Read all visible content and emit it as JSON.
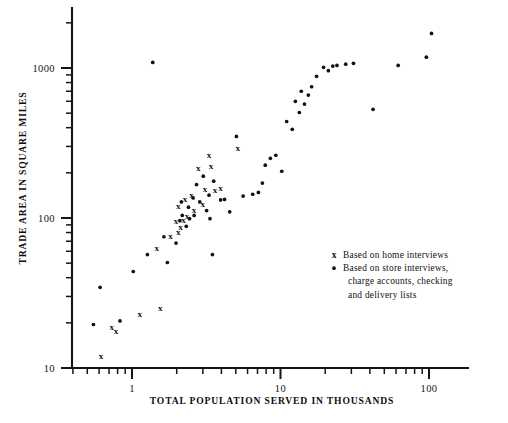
{
  "chart_data": {
    "type": "scatter",
    "title": "",
    "xlabel": "TOTAL POPULATION SERVED IN THOUSANDS",
    "ylabel": "TRADE AREA IN SQUARE MILES",
    "xscale": "log",
    "yscale": "log",
    "xlim": [
      0.5,
      200
    ],
    "ylim": [
      9,
      2500
    ],
    "xticks": [
      1,
      10,
      100
    ],
    "xticklabels": [
      "1",
      "10",
      "100"
    ],
    "yticks": [
      10,
      100,
      1000
    ],
    "yticklabels": [
      "10",
      "100",
      "1000"
    ],
    "grid": false,
    "legend_position": "lower-right-inside",
    "legend": [
      {
        "marker": "x",
        "label": "Based on home interviews"
      },
      {
        "marker": "dot",
        "label": "Based on store interviews, charge accounts, checking and delivery lists"
      }
    ],
    "legend_lines": [
      {
        "marker": "x",
        "text": "Based on home interviews"
      },
      {
        "marker": "dot",
        "text": "Based on store interviews,"
      },
      {
        "marker": "",
        "text": "charge accounts,  checking"
      },
      {
        "marker": "",
        "text": "and delivery lists"
      }
    ],
    "series": [
      {
        "name": "Based on home interviews",
        "marker": "x",
        "points": [
          [
            0.62,
            11.8
          ],
          [
            0.73,
            18.6
          ],
          [
            0.78,
            17.4
          ],
          [
            1.13,
            22.5
          ],
          [
            1.55,
            24.9
          ],
          [
            1.47,
            62.0
          ],
          [
            1.82,
            74.5
          ],
          [
            2.05,
            79.0
          ],
          [
            2.12,
            86.0
          ],
          [
            2.22,
            96.0
          ],
          [
            2.05,
            118.0
          ],
          [
            2.28,
            133.0
          ],
          [
            2.52,
            141.0
          ],
          [
            2.35,
            102.0
          ],
          [
            2.62,
            112.0
          ],
          [
            3.0,
            122.0
          ],
          [
            3.1,
            155.0
          ],
          [
            3.62,
            152.0
          ],
          [
            3.95,
            156.0
          ],
          [
            3.3,
            258.0
          ],
          [
            3.4,
            218.0
          ],
          [
            5.15,
            290.0
          ],
          [
            2.8,
            213.0
          ],
          [
            1.98,
            94.0
          ]
        ]
      },
      {
        "name": "Based on store interviews, charge accounts, checking and delivery lists",
        "marker": "dot",
        "points": [
          [
            0.55,
            19.5
          ],
          [
            0.61,
            34.5
          ],
          [
            0.83,
            20.6
          ],
          [
            1.02,
            44.0
          ],
          [
            1.27,
            57.0
          ],
          [
            1.64,
            75.0
          ],
          [
            1.73,
            50.5
          ],
          [
            1.98,
            68.0
          ],
          [
            2.1,
            96.0
          ],
          [
            2.18,
            104.0
          ],
          [
            2.32,
            88.0
          ],
          [
            2.44,
            99.0
          ],
          [
            2.15,
            128.0
          ],
          [
            2.4,
            118.0
          ],
          [
            2.58,
            136.0
          ],
          [
            2.62,
            104.0
          ],
          [
            2.72,
            167.0
          ],
          [
            2.86,
            128.0
          ],
          [
            3.02,
            190.0
          ],
          [
            3.18,
            112.0
          ],
          [
            3.3,
            142.0
          ],
          [
            3.35,
            99.0
          ],
          [
            3.48,
            57.0
          ],
          [
            3.55,
            176.0
          ],
          [
            3.95,
            132.0
          ],
          [
            4.2,
            133.0
          ],
          [
            4.55,
            110.0
          ],
          [
            5.05,
            350.0
          ],
          [
            5.6,
            140.0
          ],
          [
            6.5,
            144.0
          ],
          [
            7.1,
            148.0
          ],
          [
            7.55,
            171.0
          ],
          [
            7.9,
            225.0
          ],
          [
            8.55,
            250.0
          ],
          [
            9.3,
            262.0
          ],
          [
            10.2,
            205.0
          ],
          [
            11.0,
            440.0
          ],
          [
            12.0,
            390.0
          ],
          [
            12.6,
            600.0
          ],
          [
            13.4,
            505.0
          ],
          [
            13.8,
            700.0
          ],
          [
            14.5,
            575.0
          ],
          [
            15.4,
            660.0
          ],
          [
            16.2,
            750.0
          ],
          [
            17.5,
            880.0
          ],
          [
            19.5,
            1010.0
          ],
          [
            21.0,
            960.0
          ],
          [
            22.5,
            1030.0
          ],
          [
            24.0,
            1040.0
          ],
          [
            27.5,
            1060.0
          ],
          [
            31.0,
            1075.0
          ],
          [
            42.0,
            530.0
          ],
          [
            62.0,
            1040.0
          ],
          [
            96.0,
            1180.0
          ],
          [
            104.0,
            1700.0
          ],
          [
            1.38,
            1090.0
          ]
        ]
      }
    ]
  }
}
